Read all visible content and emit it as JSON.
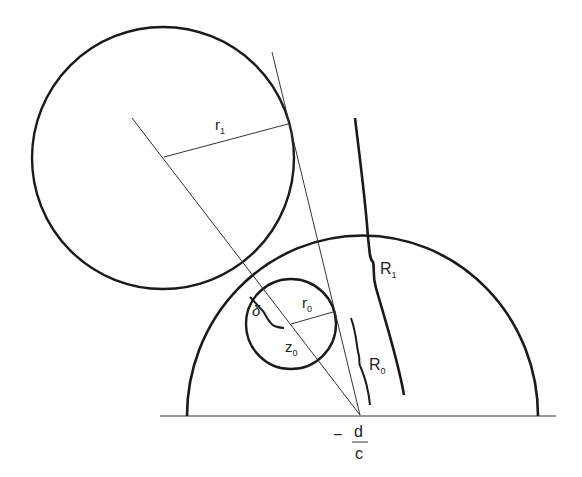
{
  "diagram": {
    "labels": {
      "r1": "r",
      "r1_sub": "1",
      "r0": "r",
      "r0_sub": "0",
      "z0": "z",
      "z0_sub": "0",
      "R1": "R",
      "R1_sub": "1",
      "R0": "R",
      "R0_sub": "0",
      "delta": "δ",
      "frac_minus": "−",
      "frac_num": "d",
      "frac_den": "c"
    },
    "colors": {
      "stroke": "#1a1a1a",
      "background": "#ffffff"
    }
  }
}
